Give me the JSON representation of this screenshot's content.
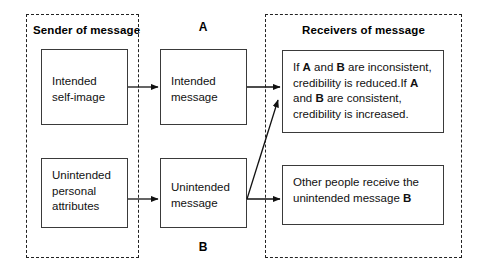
{
  "diagram": {
    "groups": [
      {
        "id": "sender",
        "label": "Sender of message"
      },
      {
        "id": "receivers",
        "label": "Receivers of message"
      }
    ],
    "column_letters": {
      "top": "A",
      "bottom": "B"
    },
    "boxes": {
      "intended_self_image": "Intended self-image",
      "unintended_personal_attributes": "Unintended personal attributes",
      "intended_message": "Intended message",
      "unintended_message": "Unintended message",
      "credibility_outcome": {
        "line1_pre": "If ",
        "line1_a": "A",
        "line1_mid": " and ",
        "line1_b": "B",
        "line1_post": " are inconsistent, credibility is reduced.",
        "line2_pre": "If ",
        "line2_a": "A",
        "line2_mid": " and ",
        "line2_b": "B",
        "line2_post": " are consistent, credibility is increased."
      },
      "other_people": {
        "text_pre": "Other people receive the unintended message ",
        "text_b": "B"
      }
    },
    "arrows": [
      {
        "id": "self-to-intended",
        "from": "intended_self_image",
        "to": "intended_message",
        "style": "straight"
      },
      {
        "id": "attrs-to-unintended",
        "from": "unintended_personal_attributes",
        "to": "unintended_message",
        "style": "straight"
      },
      {
        "id": "intended-to-credibility",
        "from": "intended_message",
        "to": "credibility_outcome",
        "style": "straight"
      },
      {
        "id": "unintended-to-other",
        "from": "unintended_message",
        "to": "other_people",
        "style": "straight"
      },
      {
        "id": "unintended-to-credibility",
        "from": "unintended_message",
        "to": "credibility_outcome",
        "style": "diagonal"
      }
    ],
    "colors": {
      "box_border": "#3a3a3a",
      "group_border": "#222222",
      "text": "#111111",
      "background": "#ffffff"
    }
  }
}
